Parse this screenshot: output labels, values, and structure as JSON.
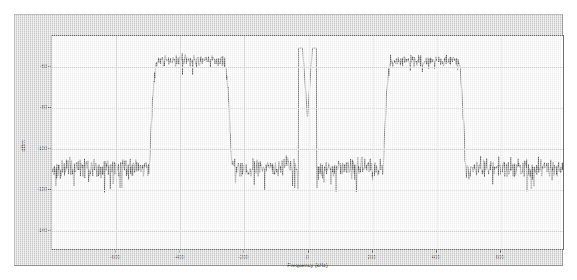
{
  "figure": {
    "background_color": "#d4d4d4",
    "axes_background_color": "#ffffff",
    "trace_color": "#404040",
    "grid_color": "#d9d9d9"
  },
  "chart_data": {
    "type": "line",
    "title": "",
    "subtitle": "",
    "xlabel": "Frequency (kHz)",
    "ylabel": "dBm",
    "xlim": [
      -800,
      800
    ],
    "ylim": [
      -150,
      -45
    ],
    "xticks": [
      -600,
      -400,
      -200,
      0,
      200,
      400,
      600
    ],
    "xticklabels": [
      "-600",
      "-400",
      "-200",
      "0",
      "200",
      "400",
      "600"
    ],
    "yticks": [
      -60,
      -80,
      -100,
      -120,
      -140
    ],
    "yticklabels": [
      "-60",
      "-80",
      "-100",
      "-120",
      "-140"
    ],
    "grid": true,
    "legend": null,
    "annotations": [
      {
        "text": "carrier spike",
        "x": 0,
        "y": -85
      },
      {
        "text": "lower sideband lobe",
        "x": -350,
        "y": -57
      },
      {
        "text": "upper sideband lobe",
        "x": 350,
        "y": -57
      }
    ],
    "series": [
      {
        "name": "Spectrum",
        "color": "#404040",
        "description": "Two-sided modulated signal spectrum: noise floor near -110 dBm, two flat-top sideband lobes near -57 dBm spanning roughly -470..-260 kHz and 260..470 kHz, plus a narrow residual carrier spike at 0 kHz reaching about -85 dBm.",
        "noise_floor_dbm": -110,
        "noise_ripple_db": 14,
        "lobe_level_dbm": -57,
        "lobe_ripple_db": 8,
        "carrier_peak_dbm": -85,
        "lobes": [
          {
            "f_start": -470,
            "f_stop": -262,
            "level": -57
          },
          {
            "f_start": 262,
            "f_stop": 470,
            "level": -57
          }
        ],
        "carrier": {
          "frequency": 0,
          "peak": -85,
          "width": 9
        }
      }
    ]
  }
}
